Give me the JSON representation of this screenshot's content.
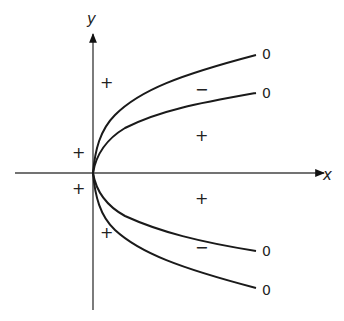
{
  "diagram": {
    "axes": {
      "x_label": "x",
      "y_label": "y"
    },
    "curve_end_labels": [
      {
        "id": "upper-outer",
        "text": "0"
      },
      {
        "id": "upper-inner",
        "text": "0"
      },
      {
        "id": "lower-inner",
        "text": "0"
      },
      {
        "id": "lower-outer",
        "text": "0"
      }
    ],
    "region_signs": [
      {
        "region": "upper-left-of-curves",
        "text": "+"
      },
      {
        "region": "left-of-y-axis-above",
        "text": "+"
      },
      {
        "region": "between-upper-curves",
        "text": "−"
      },
      {
        "region": "right-between-inner-curves-upper",
        "text": "+"
      },
      {
        "region": "left-of-y-axis-below",
        "text": "+"
      },
      {
        "region": "right-between-inner-curves-lower",
        "text": "+"
      },
      {
        "region": "lower-left-of-curves",
        "text": "+"
      },
      {
        "region": "between-lower-curves",
        "text": "−"
      }
    ],
    "colors": {
      "line": "#1a1a1a",
      "axis": "#444444",
      "background": "#ffffff"
    }
  }
}
